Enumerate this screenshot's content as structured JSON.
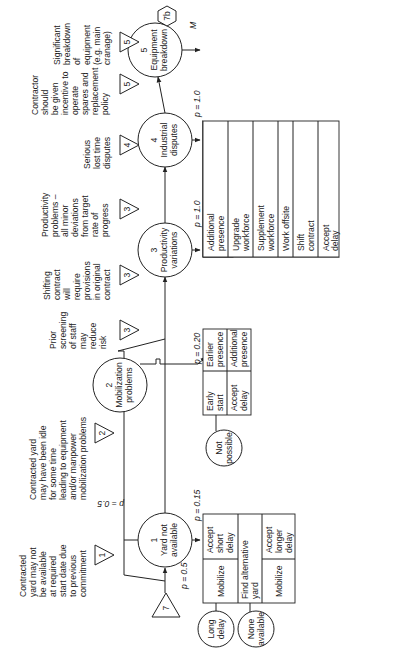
{
  "diagram": {
    "orientation": "rotated-90-ccw",
    "start_marker": {
      "label": "7",
      "shape": "triangle"
    },
    "end_marker": {
      "label": "7b",
      "shape": "hexagon"
    },
    "nodes": [
      {
        "id": "1",
        "number": "1",
        "line1": "Yard not",
        "line2": "available",
        "risk_rating": "1",
        "description": [
          "Contracted",
          "yard may not",
          "be available",
          "at required",
          "start date due",
          "to previous",
          "commitment"
        ],
        "p_in": "p = 0.5",
        "p_response": "p = 0.15"
      },
      {
        "id": "2",
        "number": "2",
        "line1": "Mobilization",
        "line2": "problems",
        "risk_rating": "2",
        "description": [
          "Contracted yard",
          "may have been idle",
          "for some time",
          "leading to equipment",
          "and/or manpower",
          "mobilization problems"
        ],
        "p_in": "p = 0.5",
        "p_response": "p = 0.20"
      },
      {
        "id": "3",
        "number": "3",
        "line1": "Productivity",
        "line2": "variations",
        "risk_rating": "3",
        "description": [
          "Shifting",
          "contract",
          "will",
          "require",
          "provisions",
          "in original",
          "contract"
        ],
        "pre_description": [
          "Prior",
          "screening",
          "of staff",
          "may",
          "reduce",
          "risk"
        ],
        "pre_risk_rating": "3",
        "p_response": "p = 1.0"
      },
      {
        "id": "4",
        "number": "4",
        "line1": "Industrial",
        "line2": "disputes",
        "risk_rating": "4",
        "description": [
          "Serious",
          "lost time",
          "disputes"
        ],
        "pre_description": [
          "Productivity",
          "problems –",
          "all minor",
          "deviations",
          "from target",
          "rate of",
          "progress"
        ],
        "pre_risk_rating": "3",
        "p_response": "p = 1.0"
      },
      {
        "id": "5",
        "number": "5",
        "line1": "Equipment",
        "line2": "breakdown",
        "risk_rating": "5",
        "description": [
          "Significant",
          "breakdown",
          "of",
          "equipment",
          "(e.g. main",
          "cranage)"
        ],
        "pre_description": [
          "Contractor",
          "should",
          "be given",
          "incentive to",
          "operate",
          "spares and",
          "replacement",
          "policy"
        ],
        "pre_risk_rating": "5",
        "response_marker": "M"
      }
    ],
    "response_tables": {
      "yard": {
        "rows": [
          {
            "left": "Mobilize",
            "right": [
              "Accept",
              "short",
              "delay"
            ]
          },
          {
            "left": [
              "Find alternative",
              "yard"
            ]
          },
          {
            "left": "Mobilize",
            "right": [
              "Accept",
              "longer",
              "delay"
            ]
          }
        ],
        "fallbacks": [
          [
            "Long",
            "delay"
          ],
          [
            "None",
            "available"
          ]
        ]
      },
      "mobilization": {
        "cells": [
          [
            "Early",
            "start"
          ],
          [
            "Earlier",
            "presence"
          ],
          [
            "Accept",
            "delay"
          ],
          [
            "Additional",
            "presence"
          ]
        ],
        "fallback": [
          "Not",
          "possible"
        ]
      },
      "productivity": {
        "cells": [
          [
            "Additional",
            "presence"
          ],
          [
            "Upgrade",
            "workforce"
          ],
          [
            "Supplement",
            "workforce"
          ],
          [
            "Work offsite"
          ],
          [
            "Shift",
            "contract"
          ],
          [
            "Accept",
            "delay"
          ]
        ],
        "fallback": [
          "No",
          "change"
        ]
      },
      "disputes": {
        "cells": [
          [
            "Arbitrate"
          ],
          [
            "Exert",
            "contractual",
            "leverage"
          ],
          [
            "Alternative",
            "contractor"
          ],
          [
            "Accept",
            "delay"
          ]
        ],
        "fallback": [
          "No",
          "success"
        ]
      },
      "equipment": {
        "cells": [
          [
            "Repair"
          ],
          [
            "Return to",
            "manufacturer",
            "for repair"
          ],
          [
            "Alternative",
            "equipment"
          ],
          [
            "Accept",
            "delay"
          ]
        ],
        "fallbacks": [
          [
            "Unsuccessful"
          ],
          [
            "None",
            "available"
          ]
        ]
      }
    },
    "notes": {
      "productivity": [
        "Variations in productivity",
        "assumed to be covered by",
        "other risks. Minimum time",
        "required for fabrication of",
        "jacket assumed to be",
        "20 months."
      ],
      "disputes": [
        "See separate",
        "analysis of lost",
        "time disputes for",
        "typical offshore",
        "fabrication yards"
      ],
      "equipment": [
        "Most significant",
        "equipment in",
        "fabrication yard will",
        "be cranage. Main",
        "cranes so vital that",
        "they are regularly",
        "maintained and",
        "repairs most likely",
        "undertaken in hours if",
        "breakdown occurs."
      ]
    }
  }
}
